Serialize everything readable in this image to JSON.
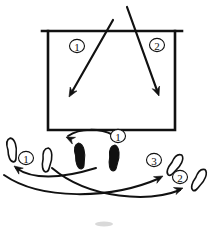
{
  "diagram": {
    "background_color": "#ffffff",
    "ink_color": "#111111",
    "width": 218,
    "height": 231,
    "court": {
      "name": "court-rectangle",
      "net_label": "net-line",
      "left": 48,
      "right": 175,
      "top": 31,
      "bottom": 130,
      "net_line_left": 42,
      "net_line_right": 182,
      "net_line_y": 31,
      "stroke_width": 2.6
    },
    "shot_labels": [
      {
        "id": "court-label-1",
        "text": "1",
        "circled": "①",
        "x": 77,
        "y": 46,
        "r": 7.5
      },
      {
        "id": "court-label-2",
        "text": "2",
        "circled": "②",
        "x": 157,
        "y": 45,
        "r": 7.5
      }
    ],
    "trajectories": [
      {
        "name": "shot-trajectory-1",
        "label": "1",
        "from_x": 113,
        "from_y": 20,
        "to_x": 69,
        "to_y": 97,
        "direction": "down-left",
        "stroke_width": 2.2
      },
      {
        "name": "shot-trajectory-2",
        "label": "2",
        "from_x": 127,
        "from_y": 7,
        "to_x": 159,
        "to_y": 96,
        "direction": "down-right",
        "stroke_width": 2.2
      }
    ],
    "footprints": [
      {
        "name": "footprint-ready-left",
        "style": "solid",
        "x": 80,
        "y": 156,
        "rotate": -6,
        "w": 11,
        "h": 26
      },
      {
        "name": "footprint-ready-right",
        "style": "solid",
        "x": 114,
        "y": 158,
        "rotate": 4,
        "w": 11,
        "h": 26
      },
      {
        "name": "footprint-step-1-outer",
        "style": "outline",
        "x": 12,
        "y": 150,
        "rotate": -8,
        "w": 10,
        "h": 24
      },
      {
        "name": "footprint-step-1-inner",
        "style": "outline",
        "x": 47,
        "y": 160,
        "rotate": 6,
        "w": 10,
        "h": 24
      },
      {
        "name": "footprint-step-3",
        "style": "outline",
        "x": 175,
        "y": 165,
        "rotate": 34,
        "w": 10,
        "h": 24
      },
      {
        "name": "footprint-step-2",
        "style": "outline",
        "x": 199,
        "y": 180,
        "rotate": 30,
        "w": 10,
        "h": 24
      }
    ],
    "step_labels": [
      {
        "id": "step-label-1-center",
        "text": "1",
        "circled": "①",
        "x": 118,
        "y": 136,
        "r": 7.5
      },
      {
        "id": "step-label-1-left",
        "text": "1",
        "circled": "①",
        "x": 26,
        "y": 158,
        "r": 7.5
      },
      {
        "id": "step-label-3-right",
        "text": "3",
        "circled": "③",
        "x": 154,
        "y": 160,
        "r": 7.5
      },
      {
        "id": "step-label-2-right",
        "text": "2",
        "circled": "②",
        "x": 180,
        "y": 177,
        "r": 7.5
      }
    ],
    "movement_arrows": [
      {
        "name": "movement-arrow-center-left",
        "path": "M 113 135 C 100 128, 80 128, 68 136",
        "head_x": 66,
        "head_y": 137,
        "head_angle": 205,
        "stroke_width": 2.0
      },
      {
        "name": "movement-arrow-to-step-1",
        "path": "M 96 168 C 70 176, 36 182, 16 168",
        "head_x": 14,
        "head_y": 166,
        "head_angle": 216,
        "stroke_width": 2.0
      },
      {
        "name": "movement-arrow-to-step-3",
        "path": "M 4 175 C 40 200, 110 200, 160 178",
        "head_x": 163,
        "head_y": 176,
        "head_angle": 333,
        "stroke_width": 2.0
      },
      {
        "name": "movement-arrow-to-step-2",
        "path": "M 52 168 C 90 200, 150 202, 180 190",
        "head_x": 183,
        "head_y": 188,
        "head_angle": 340,
        "stroke_width": 2.0
      }
    ],
    "smudges": [
      {
        "name": "bottom-smudge",
        "x": 104,
        "y": 224,
        "w": 18,
        "h": 5
      }
    ]
  }
}
